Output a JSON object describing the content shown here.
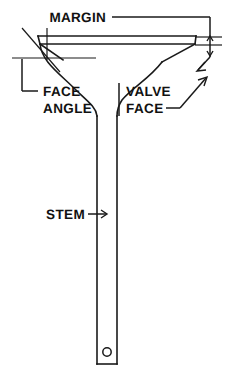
{
  "diagram": {
    "title_visible": false,
    "background_color": "#ffffff",
    "line_color": "#1a1a1a",
    "labels": {
      "margin": "MARGIN",
      "face_angle_line1": "FACE",
      "face_angle_line2": "ANGLE",
      "valve_face_line1": "VALVE",
      "valve_face_line2": "FACE",
      "stem": "STEM"
    },
    "callouts": [
      {
        "name": "margin",
        "text": "MARGIN",
        "leader": "horizontal line running right then down to a vertical dimension with arrowheads at the valve margin band"
      },
      {
        "name": "face-angle",
        "text": "FACE ANGLE",
        "leader": "L-shaped bracket rising to the horizontal angle reference line at the left of the valve head"
      },
      {
        "name": "valve-face",
        "text": "VALVE FACE",
        "leader": "diagonal arrow pointing up and right to the seating face of the valve head"
      },
      {
        "name": "stem",
        "text": "STEM",
        "leader": "horizontal arrow pointing right to the valve stem shaft"
      }
    ],
    "features": [
      "valve head with margin band",
      "valve face seating angle",
      "fillet blending head into stem",
      "straight stem shaft",
      "keeper pin hole near stem tip"
    ]
  }
}
